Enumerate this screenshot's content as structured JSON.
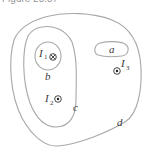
{
  "caption": "Figure 28.87",
  "diagram": {
    "curves": [
      {
        "id": "a",
        "label": "a",
        "shape": "rounded-loop",
        "encloses": []
      },
      {
        "id": "b",
        "label": "b",
        "shape": "loop",
        "encloses": [
          "I1"
        ]
      },
      {
        "id": "c",
        "label": "c",
        "shape": "loop",
        "encloses": [
          "I1",
          "I2"
        ]
      },
      {
        "id": "d",
        "label": "d",
        "shape": "loop",
        "encloses": [
          "I1",
          "I2",
          "I3"
        ]
      }
    ],
    "currents": [
      {
        "id": "I1",
        "label": "I",
        "subscript": "1",
        "direction": "into-page",
        "symbol": "⊗"
      },
      {
        "id": "I2",
        "label": "I",
        "subscript": "2",
        "direction": "out-of-page",
        "symbol": "⊙"
      },
      {
        "id": "I3",
        "label": "I",
        "subscript": "3",
        "direction": "out-of-page",
        "symbol": "⊙"
      }
    ],
    "colors": {
      "curve": "#a8a8a8",
      "text": "#3a3a3a"
    }
  },
  "labels": {
    "a": "a",
    "b": "b",
    "c": "c",
    "d": "d",
    "I": "I",
    "sub1": "1",
    "sub2": "2",
    "sub3": "3"
  }
}
